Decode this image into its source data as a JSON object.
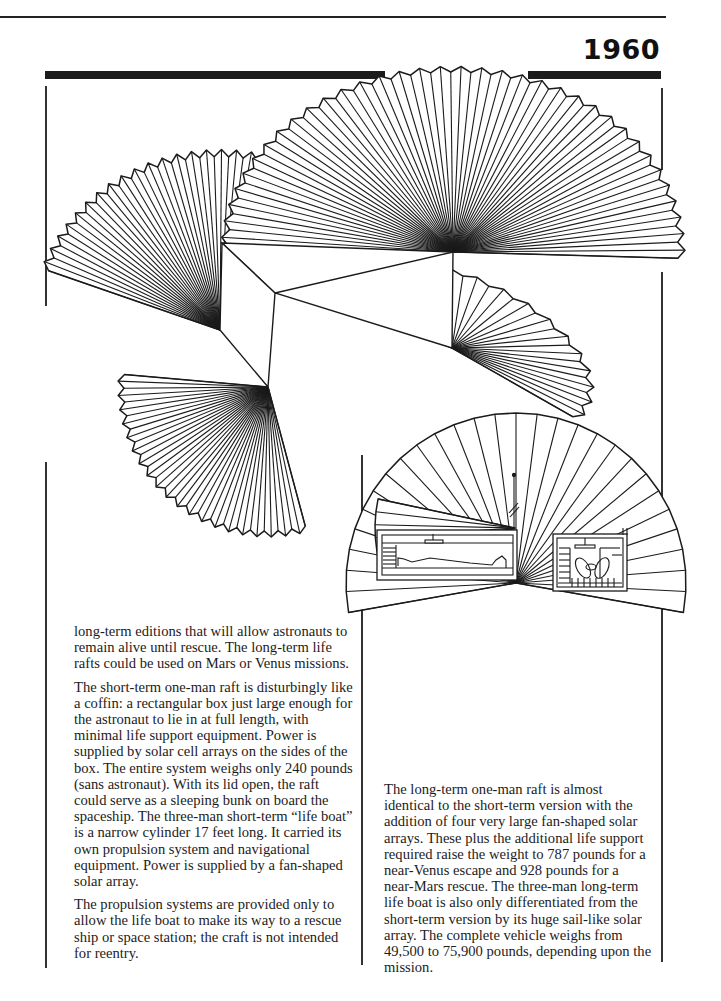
{
  "header": {
    "year": "1960"
  },
  "figures": {
    "main_diagram": {
      "name": "long-term-life-raft-with-four-fan-solar-arrays",
      "fan_count": 4
    },
    "side_diagram": {
      "name": "short-term-raft-cross-section-with-fan-solar-array",
      "compartments": [
        "one-man-raft-lying-astronaut",
        "three-man-lifeboat-seated-astronauts"
      ]
    }
  },
  "left_column": {
    "paragraphs": [
      "long-term editions that will allow astronauts to remain alive until rescue. The long-term life rafts could be used on Mars or Venus missions.",
      "The short-term one-man raft is disturbingly like a coffin: a rectangular box just large enough for the astronaut to lie in at full length, with minimal life support equipment. Power is supplied by solar cell arrays on the sides of the box. The entire system weighs only 240 pounds (sans astronaut). With its lid open, the raft could serve as a sleeping bunk on board the spaceship. The three-man short-term “life boat” is a narrow cylinder 17 feet long. It carried its own propulsion system and navigational equipment. Power is supplied by a fan-shaped solar array.",
      "The propulsion systems are provided only to allow the life boat to make its way to a rescue ship or space station; the craft is not intended for reentry."
    ]
  },
  "right_column": {
    "paragraphs": [
      "The long-term one-man raft is almost identical to the short-term version with the addition of four very large fan-shaped solar arrays. These plus the additional life support required raise the weight to 787 pounds for a near-Venus escape and 928 pounds for a near-Mars rescue. The three-man long-term life boat is also only differentiated from the short-term version by its huge sail-like solar array. The complete vehicle weighs from 49,500 to 75,900 pounds, depending upon the mission."
    ]
  },
  "colors": {
    "ink": "#1b1b1b",
    "paper": "#ffffff"
  }
}
